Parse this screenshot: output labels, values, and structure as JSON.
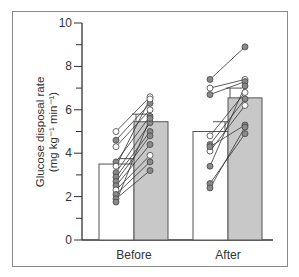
{
  "chart_data": {
    "type": "bar",
    "title": "",
    "xlabel": "",
    "ylabel": "Glucose disposal rate",
    "ylabel_units": "(mg kg⁻¹ min⁻¹)",
    "ylim": [
      0,
      10
    ],
    "yticks": [
      0,
      2,
      4,
      6,
      8,
      10
    ],
    "yticks_minor": [
      1,
      3,
      5,
      7,
      9
    ],
    "grid": false,
    "categories": [
      "Before",
      "After"
    ],
    "series": [
      {
        "name": "condition 1 (open bar)",
        "color": "#ffffff",
        "values": [
          3.5,
          5.0
        ],
        "sem": [
          0.25,
          0.45
        ]
      },
      {
        "name": "condition 2 (shaded bar)",
        "color": "#c8c8c8",
        "values": [
          5.45,
          6.55
        ],
        "sem": [
          0.35,
          0.45
        ]
      }
    ],
    "paired_points": {
      "Before": [
        {
          "from": 5.0,
          "to": 6.6,
          "open": true
        },
        {
          "from": 4.6,
          "to": 6.3,
          "open": false
        },
        {
          "from": 4.3,
          "to": 6.0,
          "open": true
        },
        {
          "from": 3.6,
          "to": 5.7,
          "open": false
        },
        {
          "from": 3.4,
          "to": 6.5,
          "open": true
        },
        {
          "from": 3.1,
          "to": 5.4,
          "open": false
        },
        {
          "from": 2.9,
          "to": 5.0,
          "open": false
        },
        {
          "from": 2.7,
          "to": 4.8,
          "open": false
        },
        {
          "from": 2.5,
          "to": 4.4,
          "open": false
        },
        {
          "from": 2.3,
          "to": 3.9,
          "open": true
        },
        {
          "from": 2.1,
          "to": 3.6,
          "open": false
        },
        {
          "from": 1.9,
          "to": 3.2,
          "open": false
        },
        {
          "from": 1.75,
          "to": 5.6,
          "open": false
        }
      ],
      "After": [
        {
          "from": 7.4,
          "to": 8.9,
          "open": false
        },
        {
          "from": 7.0,
          "to": 7.4,
          "open": true
        },
        {
          "from": 6.7,
          "to": 7.3,
          "open": false
        },
        {
          "from": 4.8,
          "to": 6.8,
          "open": true
        },
        {
          "from": 4.4,
          "to": 6.5,
          "open": false
        },
        {
          "from": 4.1,
          "to": 6.2,
          "open": true
        },
        {
          "from": 4.3,
          "to": 5.3,
          "open": false
        },
        {
          "from": 3.4,
          "to": 7.1,
          "open": false
        },
        {
          "from": 2.6,
          "to": 4.9,
          "open": false
        },
        {
          "from": 2.4,
          "to": 5.2,
          "open": false
        }
      ]
    }
  }
}
